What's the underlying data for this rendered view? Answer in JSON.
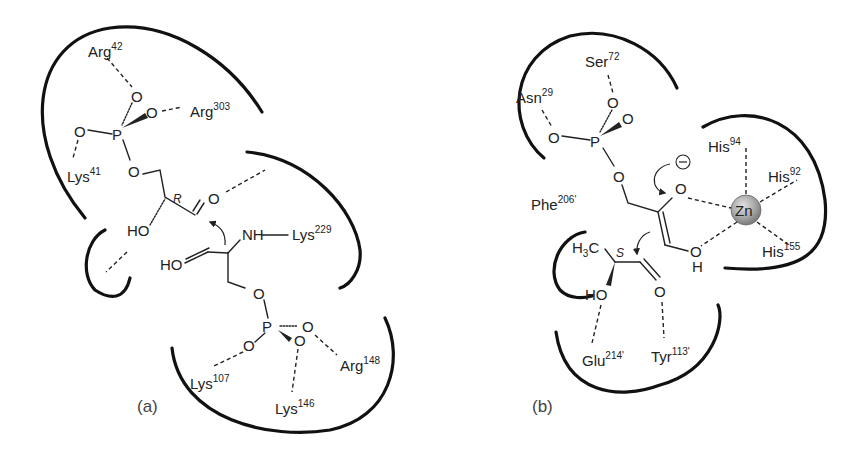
{
  "figure": {
    "panels": [
      {
        "id": "a",
        "label": "(a)",
        "stereo_label": "R",
        "residues": [
          {
            "name": "Arg",
            "number": "42"
          },
          {
            "name": "Arg",
            "number": "303"
          },
          {
            "name": "Lys",
            "number": "41"
          },
          {
            "name": "Lys",
            "number": "229"
          },
          {
            "name": "Lys",
            "number": "107"
          },
          {
            "name": "Lys",
            "number": "146"
          },
          {
            "name": "Arg",
            "number": "148"
          }
        ],
        "atoms": {
          "O": "O",
          "P": "P",
          "HO": "HO",
          "NH": "NH"
        }
      },
      {
        "id": "b",
        "label": "(b)",
        "stereo_label": "S",
        "residues": [
          {
            "name": "Ser",
            "number": "72"
          },
          {
            "name": "Asn",
            "number": "29"
          },
          {
            "name": "His",
            "number": "94"
          },
          {
            "name": "His",
            "number": "92"
          },
          {
            "name": "His",
            "number": "155"
          },
          {
            "name": "Phe",
            "number": "206'"
          },
          {
            "name": "Glu",
            "number": "214'"
          },
          {
            "name": "Tyr",
            "number": "113'"
          }
        ],
        "metal": "Zn",
        "charge": "⊖",
        "atoms": {
          "O": "O",
          "P": "P",
          "HO": "HO",
          "H": "H",
          "H3C_H": "H",
          "H3C_3": "3",
          "H3C_C": "C"
        }
      }
    ],
    "colors": {
      "line": "#111111",
      "zinc": "#a8a8a8",
      "text": "#222222"
    }
  }
}
